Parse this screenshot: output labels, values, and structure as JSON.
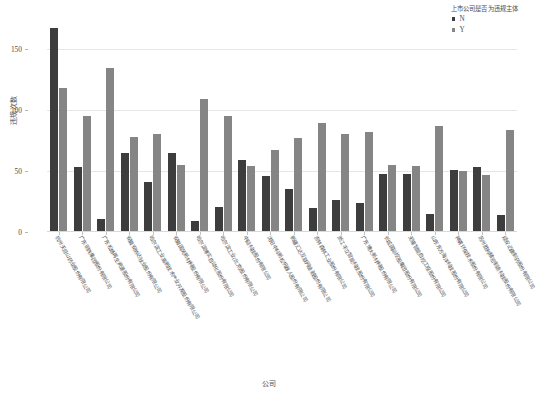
{
  "chart_data": {
    "type": "bar",
    "title": "",
    "xlabel": "公司",
    "ylabel": "违规次数",
    "ylim": [
      0,
      175
    ],
    "yticks": [
      0,
      50,
      100,
      150
    ],
    "grid": true,
    "legend_position": "top-right",
    "legend_title": "上市公司是否为违规主体",
    "categories": [
      "杭州天目山药业股份有限公司",
      "广东明珠集团股份有限公司",
      "广东松炀再生资源股份有限公司",
      "安徽安纳达钛业股份有限公司",
      "哈尔滨工业高新技术产业开发股份有限公司",
      "安徽国风新材料股份有限公司",
      "哈尔滨博实自动化股份有限公司",
      "哈尔滨工业(北京)股份有限公司",
      "中船科技股份有限公司",
      "沈阳中科新松机器人股份有限公司",
      "新疆汇达互联网金融股份有限公司",
      "吉林森林工业股份有限公司",
      "浙江丰立智能科技股份有限公司",
      "广东博大新材料股份有限公司",
      "长城国际控股集团股份有限公司",
      "无锡智能自控工程股份有限公司",
      "山东东方海洋科技股份有限公司",
      "神雾环保技术股份有限公司",
      "苏州胜利精密制造科技股份有限公司",
      "延安必康制药股份有限公司"
    ],
    "series": [
      {
        "name": "N",
        "color": "#3d3d3d",
        "values": [
          166,
          52,
          10,
          64,
          40,
          64,
          8,
          20,
          58,
          45,
          34,
          19,
          25,
          23,
          47,
          47,
          14,
          50,
          52,
          13
        ]
      },
      {
        "name": "Y",
        "color": "#858585",
        "values": [
          117,
          94,
          133,
          77,
          79,
          54,
          108,
          94,
          53,
          66,
          76,
          88,
          79,
          81,
          54,
          53,
          86,
          49,
          46,
          83
        ]
      }
    ]
  }
}
